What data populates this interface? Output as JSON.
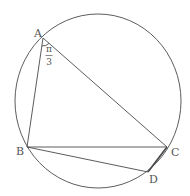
{
  "diagram": {
    "type": "inscribed-quadrilateral-in-circle",
    "colors": {
      "stroke": "#4a4a4a",
      "text": "#555555",
      "background": "#ffffff"
    },
    "circle": {
      "cx": 98,
      "cy": 101,
      "rx": 83,
      "ry": 87
    },
    "points": {
      "A": {
        "label": "A",
        "x": 43,
        "y": 38
      },
      "B": {
        "label": "B",
        "x": 27,
        "y": 147
      },
      "C": {
        "label": "C",
        "x": 167,
        "y": 147
      },
      "D": {
        "label": "D",
        "x": 148,
        "y": 172
      }
    },
    "segments": [
      "AB",
      "AC",
      "BC",
      "BD",
      "CD"
    ],
    "angle_annotation": {
      "vertex": "A",
      "numerator": "π",
      "denominator": "3",
      "meaning": "angle BAC = π/3"
    }
  }
}
